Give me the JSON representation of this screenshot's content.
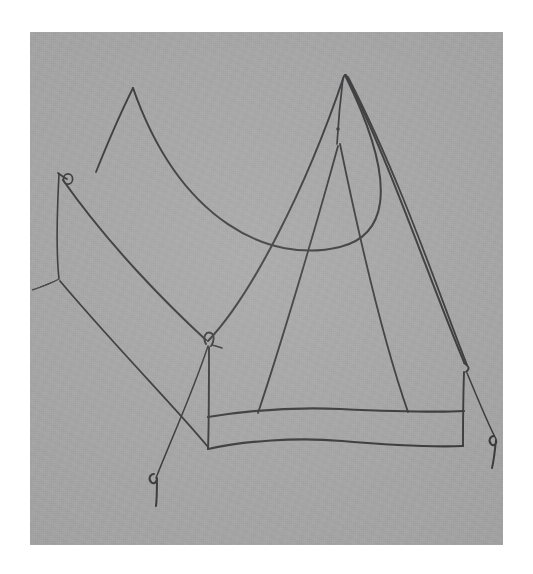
{
  "image": {
    "kind": "hand-drawn-sketch",
    "subject": "ridge camping tent",
    "medium": "pen on gray paper",
    "width": 533,
    "height": 574
  },
  "colors": {
    "page_background": "#ffffff",
    "paper": "#a9a9a9",
    "ink": "#3b3b3d",
    "ink_soft": "#4a4a4c",
    "ink_faint": "#5b5b5d"
  },
  "paper": {
    "left": 30,
    "top": 32,
    "width": 473,
    "height": 513
  },
  "ghost_text": {
    "visible": true,
    "note": "faint bleed-through of handwriting from the reverse of the sheet",
    "lines": [
      "",
      "",
      ""
    ]
  },
  "drawing": {
    "title": "Tent sketch",
    "parts": [
      {
        "name": "rear-peak",
        "label": "rear ridge peak",
        "x": 133,
        "y": 88
      },
      {
        "name": "front-peak",
        "label": "front ridge peak (apex)",
        "x": 345,
        "y": 75
      },
      {
        "name": "left-corner-loop",
        "label": "left corner guy loop",
        "x": 60,
        "y": 177
      },
      {
        "name": "front-pole-loop",
        "label": "front pole top loop",
        "x": 209,
        "y": 345
      },
      {
        "name": "right-pole-top",
        "label": "right pole top",
        "x": 463,
        "y": 363
      },
      {
        "name": "left-stake",
        "label": "left tent peg",
        "x": 155,
        "y": 480
      },
      {
        "name": "right-stake",
        "label": "right tent peg",
        "x": 491,
        "y": 440
      }
    ]
  },
  "chart_data": {
    "type": "line",
    "xlabel": "",
    "ylabel": "",
    "series": [
      {
        "name": "rear-ridge-sag",
        "values": []
      },
      {
        "name": "front-ridge-sag",
        "values": []
      },
      {
        "name": "left-side-panel-edge",
        "values": []
      },
      {
        "name": "right-side-panel-edge",
        "values": []
      },
      {
        "name": "door-flap-edges",
        "values": []
      },
      {
        "name": "ground-sheet-lines",
        "values": []
      },
      {
        "name": "guy-lines",
        "values": []
      }
    ]
  }
}
